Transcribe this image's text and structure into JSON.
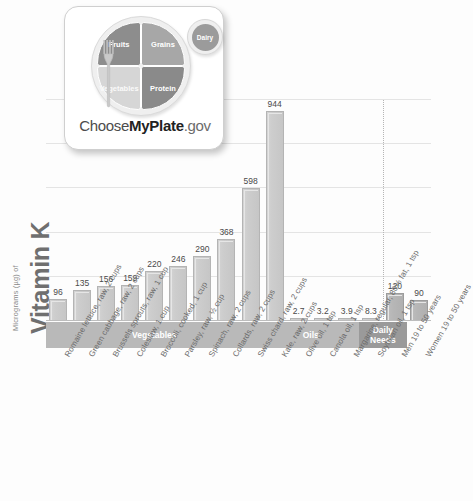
{
  "yaxis": {
    "units_label": "Micrograms (µg) of",
    "title": "Vitamin K"
  },
  "logo": {
    "name": "myplate-logo",
    "wordmark_prefix": "Choose",
    "wordmark_bold": "MyPlate",
    "wordmark_suffix": ".gov",
    "segments": {
      "fruits": "Fruits",
      "grains": "Grains",
      "vegetables": "Vegetables",
      "protein": "Protein",
      "dairy": "Dairy"
    },
    "fork_icon": "fork-icon"
  },
  "bands": [
    {
      "label": "Vegetables",
      "start_index": 0,
      "end_index": 9,
      "tone": "light"
    },
    {
      "label": "Oils",
      "start_index": 9,
      "end_index": 13,
      "tone": "light"
    },
    {
      "label": "Daily\nNeeds",
      "start_index": 13,
      "end_index": 15,
      "tone": "dark"
    }
  ],
  "colors": {
    "bar_fill": "#c9c9c9",
    "bar_border": "#b4b4b4",
    "bar_fill_dark": "#b6b6b6",
    "band_light": "#b9b9b9",
    "band_dark": "#9a9a9a",
    "gridline": "#e4e4e4",
    "axis": "#bdbdbd",
    "text": "#6b6b6b",
    "title": "#6f6f6f"
  },
  "chart_data": {
    "type": "bar",
    "title": "Vitamin K",
    "xlabel": "",
    "ylabel": "Micrograms (µg) of Vitamin K",
    "ylim": [
      0,
      1000
    ],
    "grid": true,
    "gridlines": [
      200,
      400,
      600,
      800,
      1000
    ],
    "legend": "none",
    "annotations": [
      "Dotted vertical divider separates food sources from Daily Needs reference values"
    ],
    "categories": [
      "Romaine lettuce, raw, 2 cups",
      "Green cabbage, raw, 2 cups",
      "Brussels sprouts, raw, 1 cup",
      "Coleslaw, 1 cup",
      "Broccoli, cooked, 1 cup",
      "Parsley, raw, ½ cup",
      "Spinach, raw, 2 cups",
      "Collards, raw, 2 cups",
      "Swiss chard, raw, 2 cups",
      "Kale, raw, 2 cups",
      "Olive oil, 1 tsp",
      "Canola oil, 1 tsp",
      "Margarine, regular, 80% fat, 1 tsp",
      "Soybean oil, 1 tsp",
      "Men 19 to 50 years",
      "Women 19 to 50 years"
    ],
    "values": [
      96,
      135,
      156,
      159,
      220,
      246,
      290,
      368,
      598,
      944,
      2.7,
      3.2,
      3.9,
      8.3,
      120,
      90
    ],
    "value_labels": [
      "96",
      "135",
      "156",
      "159",
      "220",
      "246",
      "290",
      "368",
      "598",
      "944",
      "2.7",
      "3.2",
      "3.9",
      "8.3",
      "120",
      "90"
    ],
    "groups": [
      "Vegetables",
      "Vegetables",
      "Vegetables",
      "Vegetables",
      "Vegetables",
      "Vegetables",
      "Vegetables",
      "Vegetables",
      "Vegetables",
      "Vegetables",
      "Oils",
      "Oils",
      "Oils",
      "Oils",
      "Daily Needs",
      "Daily Needs"
    ]
  }
}
